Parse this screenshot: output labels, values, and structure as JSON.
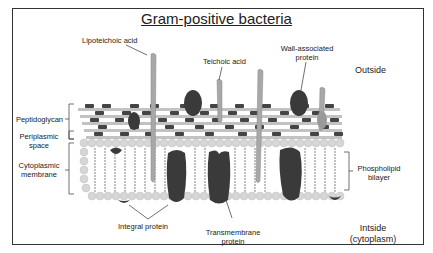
{
  "title": "Gram-positive bacteria",
  "labels": {
    "lipoteichoic_acid": "Lipoteichoic acid",
    "teichoic_acid": "Teichoic acid",
    "wall_associated_protein_1": "Wall-associated",
    "wall_associated_protein_2": "protein",
    "outside": "Outside",
    "peptidoglycan": "Peptidoglycan",
    "periplasmic_space_1": "Periplasmic",
    "periplasmic_space_2": "space",
    "cytoplasmic_membrane_1": "Cytoplasmic",
    "cytoplasmic_membrane_2": "membrane",
    "phospholipid_bilayer_1": "Phospholipid",
    "phospholipid_bilayer_2": "bilayer",
    "integral_protein": "Integral protein",
    "transmembrane_protein_1": "Transmembrane",
    "transmembrane_protein_2": "protein",
    "inside_1": "Intside",
    "inside_2": "(cytoplasm)"
  },
  "colors": {
    "dark_protein": "#3a3a3a",
    "light_strand": "#a8a8a8",
    "lipid_head": "#d4d4d4",
    "peptidoglycan_dark": "#444444",
    "peptidoglycan_light": "#bdbdbd",
    "frame": "#333333"
  }
}
